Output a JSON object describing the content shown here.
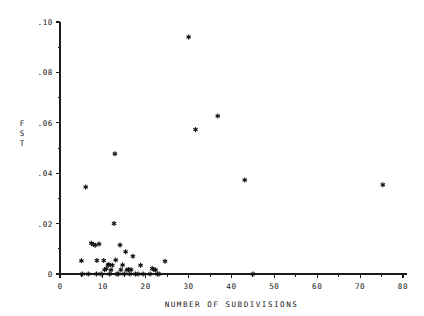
{
  "chart_data": {
    "type": "scatter",
    "title": "",
    "xlabel": "NUMBER OF SUBDIVISIONS",
    "ylabel": "FST",
    "ylabel_chars": [
      "F",
      "S",
      "T"
    ],
    "xlim": [
      0,
      80
    ],
    "ylim": [
      0,
      0.1
    ],
    "grid": false,
    "legend": null,
    "marker": "asterisk",
    "marker_color": "#111111",
    "xticks": [
      0,
      10,
      20,
      30,
      40,
      50,
      60,
      70,
      80
    ],
    "xtick_labels": [
      "0",
      "10",
      "20",
      "30",
      "40",
      "50",
      "60",
      "70",
      "80"
    ],
    "xticks_minor": [
      5,
      15,
      25,
      35,
      45,
      55,
      65,
      75
    ],
    "yticks": [
      0,
      0.02,
      0.04,
      0.06,
      0.08,
      0.1
    ],
    "ytick_labels": [
      "0",
      ".02",
      ".04",
      ".06",
      ".08",
      ".10"
    ],
    "yticks_minor": [
      0.01,
      0.03,
      0.05,
      0.07,
      0.09
    ],
    "points": [
      {
        "x": 5.0,
        "y": 0.0053
      },
      {
        "x": 5.2,
        "y": 0.0
      },
      {
        "x": 6.0,
        "y": 0.0345
      },
      {
        "x": 6.6,
        "y": 0.0
      },
      {
        "x": 7.3,
        "y": 0.0122
      },
      {
        "x": 7.8,
        "y": 0.0117
      },
      {
        "x": 8.2,
        "y": 0.0114
      },
      {
        "x": 8.5,
        "y": 0.0
      },
      {
        "x": 8.6,
        "y": 0.0054
      },
      {
        "x": 9.1,
        "y": 0.0119
      },
      {
        "x": 9.6,
        "y": 0.0
      },
      {
        "x": 10.2,
        "y": 0.0054
      },
      {
        "x": 10.4,
        "y": 0.0017
      },
      {
        "x": 10.8,
        "y": 0.0021
      },
      {
        "x": 11.2,
        "y": 0.0036
      },
      {
        "x": 11.4,
        "y": 0.0038
      },
      {
        "x": 11.6,
        "y": 0.0
      },
      {
        "x": 11.9,
        "y": 0.0016
      },
      {
        "x": 12.2,
        "y": 0.0035
      },
      {
        "x": 12.6,
        "y": 0.02
      },
      {
        "x": 12.8,
        "y": 0.0477
      },
      {
        "x": 13.0,
        "y": 0.0056
      },
      {
        "x": 13.3,
        "y": 0.0
      },
      {
        "x": 13.6,
        "y": 0.0
      },
      {
        "x": 14.0,
        "y": 0.0115
      },
      {
        "x": 14.2,
        "y": 0.0017
      },
      {
        "x": 14.6,
        "y": 0.0036
      },
      {
        "x": 15.0,
        "y": 0.0
      },
      {
        "x": 15.3,
        "y": 0.0088
      },
      {
        "x": 15.6,
        "y": 0.0016
      },
      {
        "x": 16.0,
        "y": 0.0018
      },
      {
        "x": 16.3,
        "y": 0.0
      },
      {
        "x": 16.6,
        "y": 0.0017
      },
      {
        "x": 17.0,
        "y": 0.007
      },
      {
        "x": 17.6,
        "y": 0.0
      },
      {
        "x": 18.2,
        "y": 0.0
      },
      {
        "x": 18.8,
        "y": 0.0035
      },
      {
        "x": 19.4,
        "y": 0.0
      },
      {
        "x": 21.0,
        "y": 0.0
      },
      {
        "x": 21.5,
        "y": 0.0022
      },
      {
        "x": 21.9,
        "y": 0.0018
      },
      {
        "x": 22.3,
        "y": 0.0016
      },
      {
        "x": 22.7,
        "y": 0.0
      },
      {
        "x": 23.1,
        "y": 0.0
      },
      {
        "x": 24.5,
        "y": 0.0051
      },
      {
        "x": 30.0,
        "y": 0.094
      },
      {
        "x": 31.6,
        "y": 0.0573
      },
      {
        "x": 36.8,
        "y": 0.0627
      },
      {
        "x": 43.1,
        "y": 0.0373
      },
      {
        "x": 45.0,
        "y": 0.0
      },
      {
        "x": 75.3,
        "y": 0.0354
      }
    ]
  },
  "geometry": {
    "plot_left": 60,
    "plot_right": 403,
    "plot_bottom": 274,
    "plot_top": 22
  }
}
